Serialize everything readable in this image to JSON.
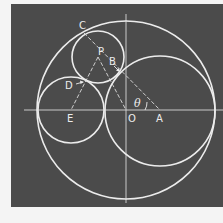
{
  "diagram": {
    "title": "",
    "background_color": "#4b4b4b",
    "line_color": "#ececec",
    "labels": {
      "C": "C",
      "P": "P",
      "B": "B",
      "D": "D",
      "E": "E",
      "O": "O",
      "A": "A",
      "theta": "θ"
    },
    "points": {
      "O": [
        126,
        110
      ],
      "A": [
        160,
        110
      ],
      "E": [
        71,
        110
      ],
      "P": [
        98,
        57
      ],
      "C": [
        82,
        30
      ]
    },
    "circles": [
      {
        "name": "outer",
        "cx": 126,
        "cy": 110,
        "r": 89
      },
      {
        "name": "circle-A",
        "cx": 160,
        "cy": 111,
        "r": 55
      },
      {
        "name": "circle-E",
        "cx": 71,
        "cy": 110,
        "r": 33
      },
      {
        "name": "circle-P",
        "cx": 98,
        "cy": 57,
        "r": 26
      }
    ]
  }
}
